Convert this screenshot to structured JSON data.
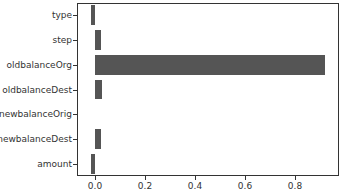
{
  "chart_data": {
    "type": "bar",
    "orientation": "horizontal",
    "title": "",
    "xlabel": "",
    "ylabel": "",
    "categories": [
      "type",
      "step",
      "oldbalanceOrg",
      "oldbalanceDest",
      "newbalanceOrig",
      "newbalanceDest",
      "amount"
    ],
    "values": [
      -0.015,
      0.022,
      0.92,
      0.027,
      0.0,
      0.024,
      -0.018
    ],
    "xlim": [
      -0.07,
      0.98
    ],
    "xticks": [
      "0.0",
      "0.2",
      "0.4",
      "0.6",
      "0.8"
    ],
    "xtick_values": [
      0.0,
      0.2,
      0.4,
      0.6,
      0.8
    ],
    "bar_color": "#555555",
    "grid": false,
    "legend": null
  }
}
